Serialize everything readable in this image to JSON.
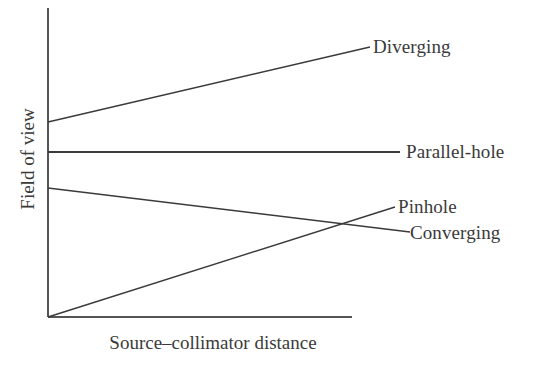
{
  "chart_data": {
    "type": "line",
    "title": "",
    "subtitle": "",
    "xlabel": "Source–collimator distance",
    "ylabel": "Field of view",
    "xlim": [
      0,
      100
    ],
    "ylim": [
      0,
      100
    ],
    "grid": false,
    "axis_ticks": false,
    "tick_labels": {
      "x": [],
      "y": []
    },
    "legend_position": "inline-right",
    "annotations": [
      "Diverging",
      "Parallel-hole",
      "Pinhole",
      "Converging"
    ],
    "series": [
      {
        "name": "Diverging",
        "label": "Diverging",
        "color": "#3a3a3a",
        "x": [
          0,
          100
        ],
        "y": [
          63.2,
          87.0
        ],
        "pixel_points": [
          [
            48,
            122
          ],
          [
            370,
            47
          ]
        ],
        "description": "Field of view increases with source-collimator distance"
      },
      {
        "name": "Parallel-hole",
        "label": "Parallel-hole",
        "color": "#3a3a3a",
        "x": [
          0,
          100
        ],
        "y": [
          53.7,
          53.7
        ],
        "pixel_points": [
          [
            48,
            152
          ],
          [
            400,
            152
          ]
        ],
        "description": "Field of view constant with source-collimator distance"
      },
      {
        "name": "Pinhole",
        "label": "Pinhole",
        "color": "#3a3a3a",
        "x": [
          0,
          100
        ],
        "y": [
          42.3,
          28.4
        ],
        "pixel_points": [
          [
            48,
            188
          ],
          [
            410,
            232
          ]
        ],
        "description": "Field of view decreases with source-collimator distance"
      },
      {
        "name": "Converging",
        "label": "Converging",
        "color": "#3a3a3a",
        "x": [
          0,
          100
        ],
        "y": [
          0.0,
          36.2
        ],
        "pixel_points": [
          [
            48,
            317
          ],
          [
            395,
            207
          ]
        ],
        "description": "Field of view increases from zero with source-collimator distance"
      }
    ],
    "intersections": [
      {
        "series": [
          "Pinhole",
          "Converging"
        ],
        "pixel_point": [
          355,
          227
        ]
      }
    ],
    "axes": {
      "color": "#555555",
      "y_axis_pixels": [
        [
          48,
          8
        ],
        [
          48,
          317
        ]
      ],
      "x_axis_pixels": [
        [
          48,
          317
        ],
        [
          352,
          317
        ]
      ]
    }
  }
}
